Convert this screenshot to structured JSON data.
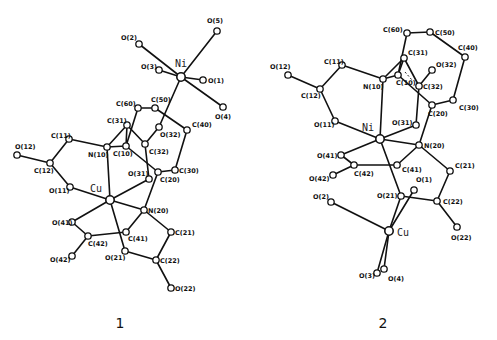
{
  "figure": {
    "structures": [
      {
        "id": "1",
        "caption": "1",
        "atoms": [
          {
            "name": "Ni",
            "label": "Ni",
            "metal": true
          },
          {
            "name": "O5",
            "label": "O(5)"
          },
          {
            "name": "O2",
            "label": "O(2)"
          },
          {
            "name": "O3",
            "label": "O(3)"
          },
          {
            "name": "O1",
            "label": "O(1)"
          },
          {
            "name": "O4",
            "label": "O(4)"
          },
          {
            "name": "C60",
            "label": "C(60)"
          },
          {
            "name": "C50",
            "label": "C(50)"
          },
          {
            "name": "C40",
            "label": "C(40)"
          },
          {
            "name": "O32",
            "label": "O(32)"
          },
          {
            "name": "C31",
            "label": "C(31)"
          },
          {
            "name": "C10",
            "label": "C(10)"
          },
          {
            "name": "C32",
            "label": "C(32)"
          },
          {
            "name": "N10",
            "label": "N(10)"
          },
          {
            "name": "C11",
            "label": "C(11)"
          },
          {
            "name": "O12",
            "label": "O(12)"
          },
          {
            "name": "C12",
            "label": "C(12)"
          },
          {
            "name": "C30",
            "label": "C(30)"
          },
          {
            "name": "C20",
            "label": "C(20)"
          },
          {
            "name": "O31",
            "label": "O(31)"
          },
          {
            "name": "O11",
            "label": "O(11)"
          },
          {
            "name": "Cu",
            "label": "Cu",
            "metal": true
          },
          {
            "name": "N20",
            "label": "N(20)"
          },
          {
            "name": "O41",
            "label": "O(41)"
          },
          {
            "name": "C41",
            "label": "C(41)"
          },
          {
            "name": "C21",
            "label": "C(21)"
          },
          {
            "name": "C42",
            "label": "C(42)"
          },
          {
            "name": "O42",
            "label": "O(42)"
          },
          {
            "name": "O21",
            "label": "O(21)"
          },
          {
            "name": "C22",
            "label": "C(22)"
          },
          {
            "name": "O22",
            "label": "O(22)"
          }
        ],
        "bonds": [
          [
            "Ni",
            "O5"
          ],
          [
            "Ni",
            "O2"
          ],
          [
            "Ni",
            "O3"
          ],
          [
            "Ni",
            "O1"
          ],
          [
            "Ni",
            "O4"
          ],
          [
            "Ni",
            "O32"
          ],
          [
            "C60",
            "C50"
          ],
          [
            "C50",
            "C40"
          ],
          [
            "C40",
            "C30"
          ],
          [
            "C30",
            "C20"
          ],
          [
            "C60",
            "C10"
          ],
          [
            "O32",
            "C32"
          ],
          [
            "C32",
            "C31"
          ],
          [
            "C31",
            "N10"
          ],
          [
            "C31",
            "C10"
          ],
          [
            "C10",
            "N10"
          ],
          [
            "C10",
            "C20"
          ],
          [
            "C32",
            "O31"
          ],
          [
            "N10",
            "C11"
          ],
          [
            "C11",
            "C12"
          ],
          [
            "C12",
            "O12"
          ],
          [
            "C12",
            "O11"
          ],
          [
            "O11",
            "Cu"
          ],
          [
            "N10",
            "Cu"
          ],
          [
            "Cu",
            "O31"
          ],
          [
            "Cu",
            "N20"
          ],
          [
            "N20",
            "C20"
          ],
          [
            "N20",
            "C41"
          ],
          [
            "N20",
            "C21"
          ],
          [
            "C21",
            "C22"
          ],
          [
            "C22",
            "O21"
          ],
          [
            "C22",
            "O22"
          ],
          [
            "Cu",
            "O21"
          ],
          [
            "Cu",
            "O41"
          ],
          [
            "O41",
            "C42"
          ],
          [
            "C42",
            "O42"
          ],
          [
            "C42",
            "C41"
          ]
        ]
      },
      {
        "id": "2",
        "caption": "2",
        "atoms": [
          {
            "name": "C60",
            "label": "C(60)"
          },
          {
            "name": "C50",
            "label": "C(50)"
          },
          {
            "name": "C40",
            "label": "C(40)"
          },
          {
            "name": "C31",
            "label": "C(31)"
          },
          {
            "name": "O32",
            "label": "O(32)"
          },
          {
            "name": "C10",
            "label": "C(10)"
          },
          {
            "name": "N10",
            "label": "N(10)"
          },
          {
            "name": "C11",
            "label": "C(11)"
          },
          {
            "name": "O12",
            "label": "O(12)"
          },
          {
            "name": "C12",
            "label": "C(12)"
          },
          {
            "name": "C32",
            "label": "C(32)"
          },
          {
            "name": "C30",
            "label": "C(30)"
          },
          {
            "name": "C20",
            "label": "C(20)"
          },
          {
            "name": "O11",
            "label": "O(11)"
          },
          {
            "name": "O31",
            "label": "O(31)"
          },
          {
            "name": "Ni",
            "label": "Ni",
            "metal": true
          },
          {
            "name": "N20",
            "label": "N(20)"
          },
          {
            "name": "O41",
            "label": "O(41)"
          },
          {
            "name": "C42",
            "label": "C(42)"
          },
          {
            "name": "C41",
            "label": "C(41)"
          },
          {
            "name": "C21",
            "label": "C(21)"
          },
          {
            "name": "O42",
            "label": "O(42)"
          },
          {
            "name": "O1",
            "label": "O(1)"
          },
          {
            "name": "O21",
            "label": "O(21)"
          },
          {
            "name": "C22",
            "label": "C(22)"
          },
          {
            "name": "O2",
            "label": "O(2)"
          },
          {
            "name": "Cu",
            "label": "Cu",
            "metal": true
          },
          {
            "name": "O22",
            "label": "O(22)"
          },
          {
            "name": "O4",
            "label": "O(4)"
          },
          {
            "name": "O3",
            "label": "O(3)"
          }
        ],
        "bonds": [
          [
            "C60",
            "C50"
          ],
          [
            "C50",
            "C40"
          ],
          [
            "C40",
            "C30"
          ],
          [
            "C30",
            "C20"
          ],
          [
            "C60",
            "C10"
          ],
          [
            "C31",
            "N10"
          ],
          [
            "C31",
            "C10"
          ],
          [
            "C31",
            "C32"
          ],
          [
            "C32",
            "O32"
          ],
          [
            "C10",
            "N10"
          ],
          [
            "C10",
            "C20"
          ],
          [
            "C32",
            "O31"
          ],
          [
            "N10",
            "C11"
          ],
          [
            "C11",
            "C12"
          ],
          [
            "C12",
            "O12"
          ],
          [
            "C12",
            "O11"
          ],
          [
            "O11",
            "Ni"
          ],
          [
            "N10",
            "Ni"
          ],
          [
            "Ni",
            "O31"
          ],
          [
            "Ni",
            "N20"
          ],
          [
            "N20",
            "C20"
          ],
          [
            "N20",
            "C41"
          ],
          [
            "N20",
            "C21"
          ],
          [
            "C21",
            "C22"
          ],
          [
            "C22",
            "O21"
          ],
          [
            "C22",
            "O22"
          ],
          [
            "Ni",
            "O21"
          ],
          [
            "Ni",
            "O41"
          ],
          [
            "O41",
            "C42"
          ],
          [
            "C42",
            "O42"
          ],
          [
            "C42",
            "C41"
          ],
          [
            "O21",
            "Cu"
          ],
          [
            "O1",
            "Cu"
          ],
          [
            "O2",
            "Cu"
          ],
          [
            "Cu",
            "O3"
          ],
          [
            "Cu",
            "O4"
          ]
        ]
      }
    ]
  }
}
